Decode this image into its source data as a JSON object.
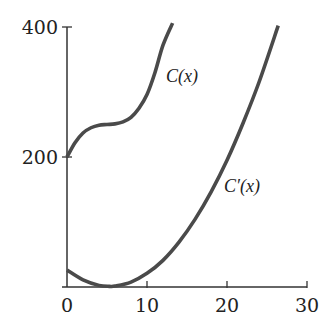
{
  "chart_data": {
    "type": "line",
    "title": "",
    "xlabel": "",
    "ylabel": "",
    "xlim": [
      0,
      30
    ],
    "ylim": [
      0,
      400
    ],
    "grid": false,
    "x_ticks": [
      0,
      10,
      20,
      30
    ],
    "y_ticks": [
      200,
      400
    ],
    "x_tick_labels": [
      "0",
      "10",
      "20",
      "30"
    ],
    "y_tick_labels": [
      "200",
      "400"
    ],
    "series": [
      {
        "name": "C(x)",
        "label": "C(x)",
        "x": [
          0,
          1,
          2,
          3,
          4,
          5,
          6,
          7,
          8,
          9,
          10,
          11,
          12,
          13.2
        ],
        "values": [
          200,
          222,
          237,
          245,
          249,
          250,
          251,
          254,
          261,
          275,
          296,
          330,
          372,
          406
        ]
      },
      {
        "name": "C'(x)",
        "label": "C′(x)",
        "x": [
          0,
          2,
          4,
          5.3,
          6,
          8,
          10,
          12,
          14,
          16,
          18,
          20,
          22,
          24,
          26.4
        ],
        "values": [
          26,
          11,
          2.5,
          1,
          1.4,
          7.6,
          21,
          41,
          69,
          104,
          146,
          195,
          252,
          315,
          402
        ]
      }
    ],
    "annotations": [
      {
        "text": "C(x)",
        "near_series": "C(x)"
      },
      {
        "text": "C′(x)",
        "near_series": "C'(x)"
      }
    ]
  }
}
